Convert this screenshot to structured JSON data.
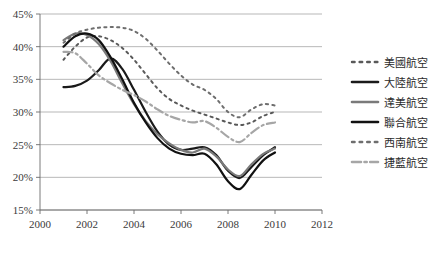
{
  "chart_data": {
    "type": "line",
    "title": "",
    "xlabel": "",
    "ylabel": "",
    "xlim": [
      2000,
      2012
    ],
    "ylim": [
      15,
      45
    ],
    "ytick_labels": [
      "15%",
      "20%",
      "25%",
      "30%",
      "35%",
      "40%",
      "45%"
    ],
    "ytick_values": [
      15,
      20,
      25,
      30,
      35,
      40,
      45
    ],
    "xtick_labels": [
      "2000",
      "2002",
      "2004",
      "2006",
      "2008",
      "2010",
      "2012"
    ],
    "xtick_values": [
      2000,
      2002,
      2004,
      2006,
      2008,
      2010,
      2012
    ],
    "grid": "horizontal",
    "legend_position": "right",
    "x": [
      2001,
      2001.5,
      2002,
      2002.5,
      2003,
      2003.5,
      2004,
      2004.5,
      2005,
      2005.5,
      2006,
      2006.5,
      2007,
      2007.5,
      2008,
      2008.5,
      2009,
      2009.5,
      2010
    ],
    "series": [
      {
        "name": "美國航空",
        "style": "dotted",
        "color": "#595959",
        "width": 2.0,
        "values": [
          38.0,
          40.0,
          41.4,
          41.6,
          41.0,
          39.8,
          38.0,
          35.8,
          33.6,
          32.0,
          31.0,
          30.2,
          29.6,
          29.0,
          28.4,
          28.0,
          28.4,
          29.4,
          30.0
        ]
      },
      {
        "name": "大陸航空",
        "style": "solid",
        "color": "#1a1a1a",
        "width": 2.2,
        "values": [
          33.8,
          34.0,
          34.8,
          36.4,
          38.2,
          36.6,
          33.4,
          30.0,
          27.0,
          25.0,
          24.2,
          24.4,
          24.6,
          23.4,
          21.0,
          19.9,
          21.6,
          23.4,
          24.6
        ]
      },
      {
        "name": "達美航空",
        "style": "solid",
        "color": "#7a7a7a",
        "width": 2.2,
        "values": [
          41.0,
          42.0,
          41.8,
          40.4,
          37.8,
          34.4,
          31.2,
          28.6,
          26.6,
          25.2,
          24.2,
          23.8,
          24.4,
          23.2,
          21.2,
          20.2,
          22.0,
          23.6,
          24.4
        ]
      },
      {
        "name": "聯合航空",
        "style": "solid",
        "color": "#111111",
        "width": 2.2,
        "values": [
          40.0,
          41.6,
          42.0,
          41.0,
          38.4,
          35.0,
          31.4,
          28.4,
          26.0,
          24.4,
          23.6,
          23.4,
          23.6,
          22.0,
          19.4,
          18.2,
          20.4,
          22.6,
          23.8
        ]
      },
      {
        "name": "西南航空",
        "style": "dotted",
        "color": "#6e6e6e",
        "width": 2.0,
        "values": [
          40.6,
          42.0,
          42.6,
          42.9,
          43.0,
          42.9,
          42.4,
          41.2,
          39.4,
          37.4,
          35.6,
          34.2,
          33.4,
          32.0,
          30.0,
          29.2,
          30.4,
          31.2,
          31.0
        ]
      },
      {
        "name": "捷藍航空",
        "style": "dashdot",
        "color": "#a6a6a6",
        "width": 2.2,
        "values": [
          39.2,
          39.0,
          37.4,
          35.6,
          34.4,
          33.4,
          32.6,
          31.6,
          30.4,
          29.4,
          28.8,
          28.4,
          28.6,
          27.6,
          26.2,
          25.4,
          26.8,
          28.0,
          28.4
        ]
      }
    ]
  },
  "legend": {
    "entries": [
      {
        "label": "美國航空"
      },
      {
        "label": "大陸航空"
      },
      {
        "label": "達美航空"
      },
      {
        "label": "聯合航空"
      },
      {
        "label": "西南航空"
      },
      {
        "label": "捷藍航空"
      }
    ]
  }
}
